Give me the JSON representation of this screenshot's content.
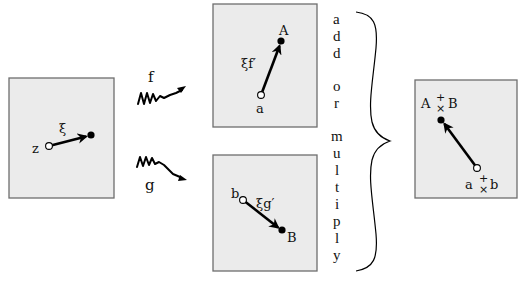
{
  "diagram": {
    "source_panel": {
      "point_label": "z",
      "vector_label": "ξ"
    },
    "maps": {
      "f": {
        "label": "f"
      },
      "g": {
        "label": "g"
      }
    },
    "image_panel_f": {
      "start_label": "a",
      "end_label": "A",
      "vector_label": "ξf′"
    },
    "image_panel_g": {
      "start_label": "b",
      "end_label": "B",
      "vector_label": "ξg′"
    },
    "operation": {
      "letters": [
        "a",
        "d",
        "d",
        "o",
        "r",
        "m",
        "u",
        "l",
        "t",
        "i",
        "p",
        "l",
        "y"
      ],
      "text": "add or multiply"
    },
    "result_panel": {
      "end_left": "A",
      "end_right": "B",
      "start_left": "a",
      "start_right": "b",
      "op_plus": "+",
      "op_times": "×"
    }
  }
}
